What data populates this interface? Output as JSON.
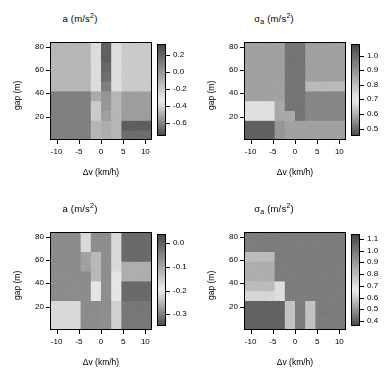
{
  "figure": {
    "background": "#ffffff",
    "colormap": "grayscale-dark-light-dark",
    "panel_count": 4
  },
  "axes": {
    "xlabel": "Δv  (km/h)",
    "ylabel": "gap (m)",
    "xticks": [
      "-10",
      "-5",
      "0",
      "5",
      "10"
    ],
    "xtick_values": [
      -10,
      -5,
      0,
      5,
      10
    ],
    "yticks": [
      "20",
      "40",
      "60",
      "80"
    ],
    "ytick_values": [
      20,
      40,
      60,
      80
    ],
    "xlim": [
      -11.5,
      11.5
    ],
    "ylim": [
      0,
      84
    ]
  },
  "titles": {
    "mean": "a  (m/s",
    "mean_sup": "2",
    "mean_close": ")",
    "sigma_main": "σ",
    "sigma_sub": "a",
    "sigma_rest": "  (m/s",
    "sigma_sup": "2",
    "sigma_close": ")"
  },
  "chart_data": [
    {
      "panel": "top-left",
      "type": "heatmap",
      "title": "a (m/s^2)",
      "xlabel": "Δv (km/h)",
      "ylabel": "gap (m)",
      "x": [
        -11.5,
        -9.2,
        -6.9,
        -4.6,
        -2.3,
        0,
        2.3,
        4.6,
        6.9,
        9.2,
        11.5
      ],
      "y": [
        0,
        8.4,
        16.8,
        25.2,
        33.6,
        42,
        50.4,
        58.8,
        67.2,
        75.6,
        84
      ],
      "zlim": [
        -0.75,
        0.33
      ],
      "cbar_ticks": [
        "0.2",
        "0.0",
        "-0.2",
        "-0.4",
        "-0.6"
      ],
      "cbar_tick_values": [
        0.2,
        0.0,
        -0.2,
        -0.4,
        -0.6
      ],
      "grid": false,
      "values": [
        [
          -0.52,
          -0.52,
          -0.52,
          -0.52,
          -0.3,
          0.08,
          -0.3,
          -0.6,
          -0.6,
          -0.6
        ],
        [
          -0.52,
          -0.52,
          -0.52,
          -0.52,
          -0.3,
          0.08,
          -0.3,
          -0.66,
          -0.66,
          -0.66
        ],
        [
          -0.52,
          -0.52,
          -0.52,
          -0.52,
          -0.22,
          0.12,
          -0.3,
          -0.4,
          -0.4,
          -0.4
        ],
        [
          -0.52,
          -0.52,
          -0.52,
          -0.52,
          -0.22,
          0.14,
          -0.3,
          -0.4,
          -0.4,
          -0.4
        ],
        [
          -0.52,
          -0.52,
          -0.52,
          -0.52,
          -0.35,
          0.14,
          -0.3,
          -0.4,
          -0.4,
          -0.4
        ],
        [
          -0.3,
          -0.3,
          -0.3,
          -0.3,
          -0.04,
          0.2,
          -0.14,
          -0.22,
          -0.22,
          -0.22
        ],
        [
          -0.3,
          -0.3,
          -0.3,
          -0.3,
          -0.04,
          0.24,
          -0.14,
          -0.22,
          -0.22,
          -0.22
        ],
        [
          -0.3,
          -0.3,
          -0.3,
          -0.3,
          -0.04,
          0.26,
          -0.14,
          -0.22,
          -0.22,
          -0.22
        ],
        [
          -0.3,
          -0.3,
          -0.3,
          -0.3,
          -0.04,
          0.28,
          -0.14,
          -0.22,
          -0.22,
          -0.22
        ],
        [
          -0.3,
          -0.3,
          -0.3,
          -0.3,
          -0.04,
          0.28,
          -0.14,
          -0.22,
          -0.22,
          -0.22
        ]
      ]
    },
    {
      "panel": "top-right",
      "type": "heatmap",
      "title": "σ_a (m/s^2)",
      "xlabel": "Δv (km/h)",
      "ylabel": "gap (m)",
      "x": [
        -11.5,
        -9.2,
        -6.9,
        -4.6,
        -2.3,
        0,
        2.3,
        4.6,
        6.9,
        9.2,
        11.5
      ],
      "y": [
        0,
        8.4,
        16.8,
        25.2,
        33.6,
        42,
        50.4,
        58.8,
        67.2,
        75.6,
        84
      ],
      "zlim": [
        0.45,
        1.08
      ],
      "cbar_ticks": [
        "1.0",
        "0.9",
        "0.8",
        "0.7",
        "0.6",
        "0.5"
      ],
      "cbar_tick_values": [
        1.0,
        0.9,
        0.8,
        0.7,
        0.6,
        0.5
      ],
      "grid": false,
      "values": [
        [
          1.05,
          1.05,
          1.05,
          0.97,
          0.66,
          0.66,
          0.66,
          0.66,
          0.66,
          0.66
        ],
        [
          1.05,
          1.05,
          1.05,
          0.97,
          0.66,
          0.66,
          0.66,
          0.66,
          0.66,
          0.66
        ],
        [
          0.86,
          0.86,
          0.86,
          0.68,
          0.68,
          1.02,
          0.6,
          0.6,
          0.6,
          0.6
        ],
        [
          0.86,
          0.86,
          0.86,
          0.68,
          1.02,
          1.02,
          0.6,
          0.6,
          0.6,
          0.6
        ],
        [
          0.66,
          0.66,
          0.66,
          0.66,
          1.02,
          1.02,
          0.6,
          0.6,
          0.6,
          0.6
        ],
        [
          0.66,
          0.66,
          0.66,
          0.66,
          1.02,
          1.02,
          0.72,
          0.72,
          0.72,
          0.72
        ],
        [
          0.66,
          0.66,
          0.66,
          0.66,
          1.02,
          1.02,
          0.66,
          0.66,
          0.66,
          0.66
        ],
        [
          0.66,
          0.66,
          0.66,
          0.66,
          1.02,
          1.02,
          0.66,
          0.66,
          0.66,
          0.66
        ],
        [
          0.66,
          0.66,
          0.66,
          0.66,
          1.02,
          1.02,
          0.66,
          0.66,
          0.66,
          0.66
        ],
        [
          0.66,
          0.66,
          0.66,
          0.66,
          1.02,
          1.02,
          0.66,
          0.66,
          0.66,
          0.66
        ]
      ]
    },
    {
      "panel": "bottom-left",
      "type": "heatmap",
      "title": "a (m/s^2)",
      "xlabel": "Δv (km/h)",
      "ylabel": "gap (m)",
      "x": [
        -11.5,
        -9.2,
        -6.9,
        -4.6,
        -2.3,
        0,
        2.3,
        4.6,
        6.9,
        9.2,
        11.5
      ],
      "y": [
        0,
        8.4,
        16.8,
        25.2,
        33.6,
        42,
        50.4,
        58.8,
        67.2,
        75.6,
        84
      ],
      "zlim": [
        -0.35,
        0.04
      ],
      "cbar_ticks": [
        "0.0",
        "-0.1",
        "-0.2",
        "-0.3"
      ],
      "cbar_tick_values": [
        0.0,
        -0.1,
        -0.2,
        -0.3
      ],
      "grid": false,
      "values": [
        [
          -0.09,
          -0.09,
          -0.09,
          -0.25,
          -0.25,
          -0.02,
          -0.15,
          -0.28,
          -0.28,
          -0.28
        ],
        [
          -0.09,
          -0.09,
          -0.09,
          -0.25,
          -0.25,
          -0.02,
          -0.15,
          -0.28,
          -0.28,
          -0.28
        ],
        [
          -0.09,
          -0.09,
          -0.09,
          -0.25,
          -0.25,
          -0.02,
          -0.15,
          -0.28,
          -0.28,
          -0.28
        ],
        [
          -0.25,
          -0.25,
          -0.25,
          -0.25,
          -0.12,
          -0.02,
          -0.12,
          -0.3,
          -0.3,
          -0.3
        ],
        [
          -0.25,
          -0.25,
          -0.25,
          -0.25,
          -0.12,
          -0.02,
          -0.12,
          -0.3,
          -0.3,
          -0.3
        ],
        [
          -0.25,
          -0.25,
          -0.25,
          -0.25,
          -0.06,
          -0.02,
          -0.12,
          -0.2,
          -0.2,
          -0.2
        ],
        [
          -0.25,
          -0.25,
          -0.25,
          -0.22,
          -0.06,
          -0.02,
          -0.09,
          -0.2,
          -0.2,
          -0.2
        ],
        [
          -0.25,
          -0.25,
          -0.25,
          -0.22,
          -0.06,
          -0.02,
          -0.09,
          -0.3,
          -0.3,
          -0.3
        ],
        [
          -0.25,
          -0.25,
          -0.25,
          -0.09,
          -0.02,
          -0.02,
          -0.09,
          -0.3,
          -0.3,
          -0.3
        ],
        [
          -0.25,
          -0.25,
          -0.25,
          -0.09,
          -0.02,
          -0.02,
          -0.09,
          -0.3,
          -0.3,
          -0.3
        ]
      ]
    },
    {
      "panel": "bottom-right",
      "type": "heatmap",
      "title": "σ_a (m/s^2)",
      "xlabel": "Δv (km/h)",
      "ylabel": "gap (m)",
      "x": [
        -11.5,
        -9.2,
        -6.9,
        -4.6,
        -2.3,
        0,
        2.3,
        4.6,
        6.9,
        9.2,
        11.5
      ],
      "y": [
        0,
        8.4,
        16.8,
        25.2,
        33.6,
        42,
        50.4,
        58.8,
        67.2,
        75.6,
        84
      ],
      "zlim": [
        0.36,
        1.14
      ],
      "cbar_ticks": [
        "1.1",
        "1.0",
        "0.9",
        "0.8",
        "0.7",
        "0.6",
        "0.5",
        "0.4"
      ],
      "cbar_tick_values": [
        1.1,
        1.0,
        0.9,
        0.8,
        0.7,
        0.6,
        0.5,
        0.4
      ],
      "grid": false,
      "values": [
        [
          1.1,
          1.1,
          1.1,
          1.1,
          0.72,
          1.05,
          0.72,
          1.05,
          1.05,
          1.05
        ],
        [
          1.1,
          1.1,
          1.1,
          1.1,
          0.72,
          1.05,
          0.72,
          1.05,
          1.05,
          1.05
        ],
        [
          1.1,
          1.1,
          1.1,
          1.1,
          0.72,
          1.05,
          0.72,
          1.05,
          1.05,
          1.05
        ],
        [
          0.78,
          0.78,
          0.78,
          0.8,
          1.05,
          1.05,
          1.05,
          1.05,
          1.05,
          1.05
        ],
        [
          0.7,
          0.7,
          0.7,
          0.8,
          1.05,
          1.05,
          1.05,
          1.05,
          1.05,
          1.05
        ],
        [
          0.66,
          0.66,
          0.66,
          1.05,
          1.05,
          1.05,
          1.05,
          1.05,
          1.05,
          1.05
        ],
        [
          0.66,
          0.66,
          0.66,
          1.05,
          1.05,
          1.05,
          1.05,
          1.05,
          1.05,
          1.05
        ],
        [
          0.7,
          0.7,
          0.7,
          1.05,
          1.05,
          1.05,
          1.05,
          1.05,
          1.05,
          1.05
        ],
        [
          1.05,
          1.05,
          1.05,
          1.05,
          1.05,
          1.05,
          1.05,
          1.05,
          1.05,
          1.05
        ],
        [
          1.05,
          1.05,
          1.05,
          1.05,
          1.05,
          1.05,
          1.05,
          1.05,
          1.05,
          1.05
        ]
      ]
    }
  ]
}
